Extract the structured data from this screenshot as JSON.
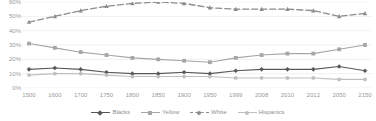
{
  "chart_data": {
    "type": "line",
    "title": "",
    "xlabel": "",
    "ylabel": "",
    "ylim": [
      0,
      60
    ],
    "yticks": [
      0,
      10,
      20,
      30,
      40,
      50,
      60
    ],
    "ytick_labels": [
      "0%",
      "10%",
      "20%",
      "30%",
      "40%",
      "50%",
      "60%"
    ],
    "grid": true,
    "legend_position": "bottom",
    "categories": [
      "1500",
      "1600",
      "1700",
      "1750",
      "1800",
      "1850",
      "1900",
      "1950",
      "1999",
      "2008",
      "2010",
      "2012",
      "2050",
      "2150"
    ],
    "series": [
      {
        "name": "Blacks",
        "color": "#595959",
        "marker": "diamond",
        "linestyle": "solid",
        "values": [
          13,
          14,
          13,
          11,
          10,
          10,
          11,
          10,
          12,
          13,
          13,
          13,
          15,
          12
        ]
      },
      {
        "name": "Yellow",
        "color": "#a6a6a6",
        "marker": "square",
        "linestyle": "solid",
        "values": [
          31,
          28,
          25,
          23,
          21,
          20,
          19,
          18,
          21,
          23,
          24,
          24,
          27,
          30
        ]
      },
      {
        "name": "White",
        "color": "#8c8c8c",
        "marker": "triangle",
        "linestyle": "dashed",
        "values": [
          46,
          50,
          54,
          57,
          59,
          60,
          59,
          56,
          55,
          55,
          55,
          54,
          50,
          52
        ]
      },
      {
        "name": "Hispanics",
        "color": "#bfbfbf",
        "marker": "circle",
        "linestyle": "solid",
        "values": [
          9,
          10,
          10,
          9,
          8,
          8,
          8,
          8,
          7,
          7,
          7,
          7,
          6,
          6
        ]
      }
    ]
  }
}
